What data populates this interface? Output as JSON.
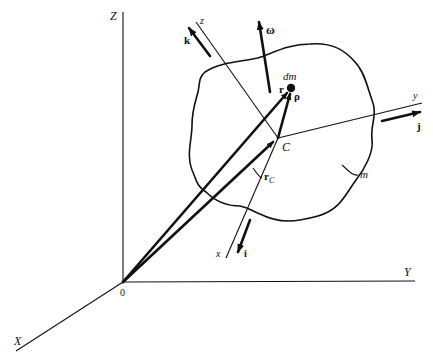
{
  "diagram": {
    "colors": {
      "ink": "#111111",
      "background": "#ffffff"
    },
    "inertial_axes": {
      "origin_label": "0",
      "X_label": "X",
      "Y_label": "Y",
      "Z_label": "Z"
    },
    "body_axes": {
      "x_label": "x",
      "y_label": "y",
      "z_label": "z"
    },
    "unit_vectors": {
      "i_label": "i",
      "j_label": "j",
      "k_label": "k"
    },
    "angular_velocity_label": "ω",
    "mass_element_label": "dm",
    "center_of_mass_label": "C",
    "body_mass_label": "m",
    "position_vectors": {
      "r_label": "r",
      "rho_label": "ρ",
      "rC_label": "r",
      "rC_subscript": "C"
    }
  }
}
